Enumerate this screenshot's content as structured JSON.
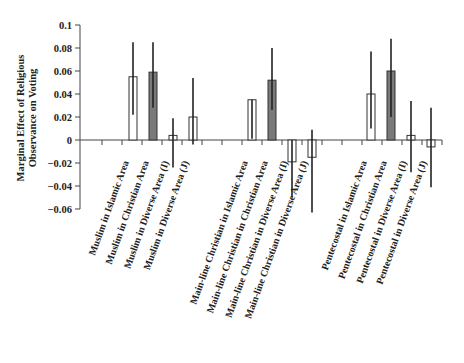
{
  "chart_data": {
    "type": "bar",
    "title": "",
    "xlabel": "",
    "ylabel": "Marginal Effect of Religious Observance on Voting",
    "ylabel_lines": [
      "Marginal Effect of Religious",
      "Observance on Voting"
    ],
    "ylim": [
      -0.06,
      0.1
    ],
    "yticks": [
      0.1,
      0.08,
      0.06,
      0.04,
      0.02,
      0,
      -0.02,
      -0.04,
      -0.06
    ],
    "ytick_labels": [
      "0.1",
      "0.08",
      "0.06",
      "0.04",
      "0.02",
      "0",
      "−0.02",
      "−0.04",
      "−0.06"
    ],
    "grid": false,
    "legend": null,
    "error_bars": true,
    "colors": {
      "open": "#ffffff",
      "filled": "#7a7a7a",
      "stroke": "#333333"
    },
    "categories": [
      "Muslim in Islamic Area",
      "Muslim in Christian Area",
      "Muslim in Diverse Area (I)",
      "Muslim in Diverse Area (J)",
      "Main-line Christian in Islamic Area",
      "Main-line Christian in Christian Area",
      "Main-line Christian in Diverse Area (I)",
      "Main-line Christian in Diverse Area (J)",
      "Pentecostal in Islamic Area",
      "Pentecostal in Christian Area",
      "Pentecostal in Diverse Area (I)",
      "Pentecostal in Diverse Area (J)"
    ],
    "values": [
      0.055,
      0.059,
      0.004,
      0.02,
      0.035,
      0.052,
      -0.019,
      -0.015,
      0.04,
      0.06,
      0.004,
      -0.006
    ],
    "error_low": [
      0.022,
      0.028,
      -0.024,
      -0.004,
      0.001,
      0.026,
      -0.05,
      -0.063,
      0.01,
      0.02,
      -0.028,
      -0.041
    ],
    "error_high": [
      0.085,
      0.085,
      0.019,
      0.054,
      0.035,
      0.08,
      0.0,
      0.009,
      0.077,
      0.088,
      0.034,
      0.028
    ],
    "filled": [
      false,
      true,
      false,
      false,
      false,
      true,
      false,
      false,
      false,
      true,
      false,
      false
    ],
    "groups": [
      "Muslim",
      "Main-line Christian",
      "Pentecostal"
    ]
  }
}
